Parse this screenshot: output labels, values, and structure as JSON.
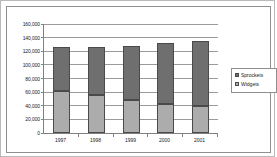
{
  "chart_data": {
    "type": "bar",
    "subtype": "stacked-bar",
    "title": "",
    "xlabel": "",
    "ylabel": "",
    "categories": [
      "1997",
      "1998",
      "1999",
      "2000",
      "2001"
    ],
    "series": [
      {
        "name": "Widgets",
        "values": [
          61000,
          56000,
          49000,
          43000,
          40000
        ],
        "color": "#acacac"
      },
      {
        "name": "Sprockets",
        "values": [
          65000,
          70000,
          79000,
          89000,
          95000
        ],
        "color": "#6f6f6f"
      }
    ],
    "stack_order": [
      "Widgets",
      "Sprockets"
    ],
    "totals": [
      126000,
      126000,
      128000,
      132000,
      135000
    ],
    "ylim": [
      0,
      160000
    ],
    "ytick_step": 20000,
    "ytick_values": [
      160000,
      140000,
      120000,
      100000,
      80000,
      60000,
      40000,
      20000,
      0
    ],
    "ytick_labels": [
      "160,000",
      "140,000",
      "120,000",
      "100,000",
      "80,000",
      "60,000",
      "40,000",
      "20,000",
      "0"
    ],
    "grid": true,
    "grid_axis": "y",
    "legend_position": "right"
  },
  "legend": {
    "entries": [
      {
        "label": "Sprockets",
        "color": "#6f6f6f"
      },
      {
        "label": "Widgets",
        "color": "#acacac"
      }
    ]
  },
  "colors": {
    "sprockets": "#6f6f6f",
    "widgets": "#acacac",
    "gridline": "#9a9a9a",
    "axis": "#808080",
    "frame": "#8f8f8f",
    "text": "#1a1a1a"
  }
}
